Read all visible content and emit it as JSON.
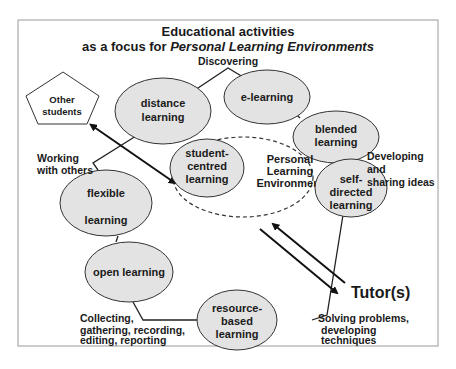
{
  "title": {
    "line1": "Educational activities",
    "line2_prefix": "as a focus for ",
    "line2_italic": "Personal Learning Environments"
  },
  "colors": {
    "node_fill": "#e3e3e3",
    "stroke": "#222222",
    "frame": "#9a9a9a",
    "background": "#ffffff"
  },
  "nodes": {
    "distance": {
      "line1": "distance",
      "line2": "learning"
    },
    "elearning": {
      "line1": "e-learning"
    },
    "blended": {
      "line1": "blended",
      "line2": "learning"
    },
    "student_centred": {
      "line1": "student-",
      "line2": "centred",
      "line3": "learning"
    },
    "self_directed": {
      "line1": "self-",
      "line2": "directed",
      "line3": "learning"
    },
    "flexible": {
      "line1": "flexible",
      "line2": "learning"
    },
    "open": {
      "line1": "open learning"
    },
    "resource_based": {
      "line1": "resource-",
      "line2": "based",
      "line3": "learning"
    }
  },
  "ple": {
    "line1": "Personal",
    "line2": "Learning",
    "line3": "Environment"
  },
  "actors": {
    "other_students": {
      "line1": "Other",
      "line2": "students"
    },
    "tutors": "Tutor(s)"
  },
  "activities": {
    "discovering": "Discovering",
    "working": {
      "line1": "Working",
      "line2": "with others"
    },
    "developing": {
      "line1": "Developing",
      "line2": "and",
      "line3": "sharing ideas"
    },
    "solving": {
      "line1": "Solving problems,",
      "line2": "developing",
      "line3": "techniques"
    },
    "collecting": {
      "line1": "Collecting,",
      "line2": "gathering, recording,",
      "line3": "editing, reporting"
    }
  }
}
